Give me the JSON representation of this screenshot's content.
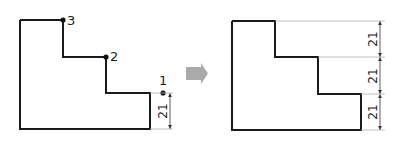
{
  "diagram": {
    "left_figure": {
      "points": [
        {
          "label": "1"
        },
        {
          "label": "2"
        },
        {
          "label": "3"
        }
      ],
      "dimension": {
        "value": "21"
      }
    },
    "arrow": {
      "color": "#aaaaaa"
    },
    "right_figure": {
      "dimensions": [
        {
          "value": "21"
        },
        {
          "value": "21"
        },
        {
          "value": "21"
        }
      ]
    },
    "colors": {
      "outline": "#1a1a1a",
      "extension": "#b0b0b0",
      "arrow": "#aaaaaa"
    }
  }
}
